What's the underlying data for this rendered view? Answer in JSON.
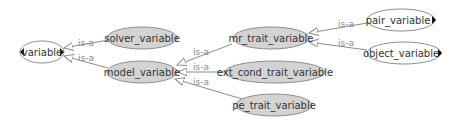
{
  "colors": {
    "node_gray_fill": "#d3d3d3",
    "node_white_fill": "#ffffff",
    "node_stroke": "#8f8f8f",
    "edge_stroke": "#8a8a8a",
    "label_text": "#333333",
    "edge_label_text": "#8a8a8a"
  },
  "nodes": [
    {
      "id": "variable",
      "label": "variable",
      "style": "white",
      "has_left_arrow": true,
      "has_right_arrow": true
    },
    {
      "id": "solver_variable",
      "label": "solver_variable",
      "style": "gray"
    },
    {
      "id": "model_variable",
      "label": "model_variable",
      "style": "gray"
    },
    {
      "id": "mr_trait_variable",
      "label": "mr_trait_variable",
      "style": "gray"
    },
    {
      "id": "ext_cond_trait_variable",
      "label": "ext_cond_trait_variable",
      "style": "gray"
    },
    {
      "id": "pe_trait_variable",
      "label": "pe_trait_variable",
      "style": "gray"
    },
    {
      "id": "pair_variable",
      "label": "pair_variable",
      "style": "white",
      "has_right_arrow": true
    },
    {
      "id": "object_variable",
      "label": "object_variable",
      "style": "white",
      "has_right_arrow": true
    }
  ],
  "edges": [
    {
      "from": "solver_variable",
      "to": "variable",
      "label": "is-a"
    },
    {
      "from": "model_variable",
      "to": "variable",
      "label": "is-a"
    },
    {
      "from": "mr_trait_variable",
      "to": "model_variable",
      "label": "is-a"
    },
    {
      "from": "ext_cond_trait_variable",
      "to": "model_variable",
      "label": "is-a"
    },
    {
      "from": "pe_trait_variable",
      "to": "model_variable",
      "label": "is-a"
    },
    {
      "from": "pair_variable",
      "to": "mr_trait_variable",
      "label": "is-a"
    },
    {
      "from": "object_variable",
      "to": "mr_trait_variable",
      "label": "is-a"
    }
  ]
}
